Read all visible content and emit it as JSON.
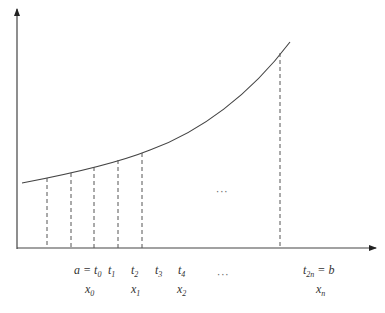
{
  "diagram": {
    "type": "riemann-partition-curve",
    "axes": {
      "x_axis": "horizontal arrow",
      "y_axis": "vertical arrow"
    },
    "t_labels": [
      {
        "text": "a = t",
        "sub": "0",
        "x": 77
      },
      {
        "text": "t",
        "sub": "1",
        "x": 108
      },
      {
        "text": "t",
        "sub": "2",
        "x": 131
      },
      {
        "text": "t",
        "sub": "3",
        "x": 155
      },
      {
        "text": "t",
        "sub": "4",
        "x": 178
      },
      {
        "text": "t",
        "sub": "2n",
        "suffix": " = b",
        "x": 303
      }
    ],
    "x_labels": [
      {
        "text": "x",
        "sub": "0",
        "x": 85
      },
      {
        "text": "x",
        "sub": "1",
        "x": 131
      },
      {
        "text": "x",
        "sub": "2",
        "x": 177
      },
      {
        "text": "x",
        "sub": "n",
        "x": 316
      }
    ],
    "ellipsis_mid": "···",
    "ellipsis_labels": "···",
    "dashed_lines_x": [
      47,
      71,
      94,
      118,
      142,
      280
    ],
    "colors": {
      "stroke": "#444444",
      "dash": "#555555"
    }
  }
}
